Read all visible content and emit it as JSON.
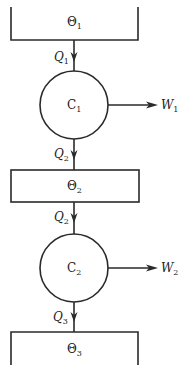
{
  "diagram": {
    "colors": {
      "line": "#2a2a2a",
      "text": "#222222",
      "background": "#ffffff"
    },
    "reservoirs": [
      {
        "id": "theta1",
        "symbol": "Θ",
        "subscript": "1",
        "shape": "open-top-reservoir"
      },
      {
        "id": "theta2",
        "symbol": "Θ",
        "subscript": "2",
        "shape": "closed-box"
      },
      {
        "id": "theta3",
        "symbol": "Θ",
        "subscript": "3",
        "shape": "open-bottom-reservoir"
      }
    ],
    "engines": [
      {
        "id": "c1",
        "symbol": "C",
        "subscript": "1"
      },
      {
        "id": "c2",
        "symbol": "C",
        "subscript": "2"
      }
    ],
    "heat_flows": [
      {
        "id": "q1_top",
        "symbol": "Q",
        "subscript": "1",
        "from": "theta1",
        "to": "c1"
      },
      {
        "id": "q2_out",
        "symbol": "Q",
        "subscript": "2",
        "from": "c1",
        "to": "theta2"
      },
      {
        "id": "q2_in",
        "symbol": "Q",
        "subscript": "2",
        "from": "theta2",
        "to": "c2"
      },
      {
        "id": "q3",
        "symbol": "Q",
        "subscript": "3",
        "from": "c2",
        "to": "theta3"
      }
    ],
    "work_outputs": [
      {
        "id": "w1",
        "symbol": "W",
        "subscript": "1",
        "from": "c1"
      },
      {
        "id": "w2",
        "symbol": "W",
        "subscript": "2",
        "from": "c2"
      }
    ]
  }
}
